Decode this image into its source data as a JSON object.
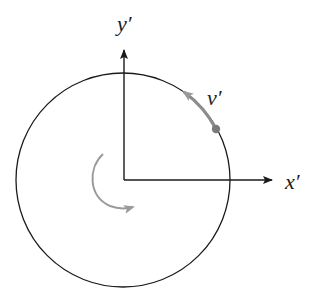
{
  "diagram": {
    "type": "rotating-frame-circle",
    "labels": {
      "y_axis": "y′",
      "x_axis": "x′",
      "velocity": "v′"
    },
    "colors": {
      "axes": "#1a1a1a",
      "circle": "#1a1a1a",
      "velocity_arrow": "#8c8c8c",
      "rotation_arrow": "#9a9a9a",
      "point": "#7a7a7a"
    }
  }
}
